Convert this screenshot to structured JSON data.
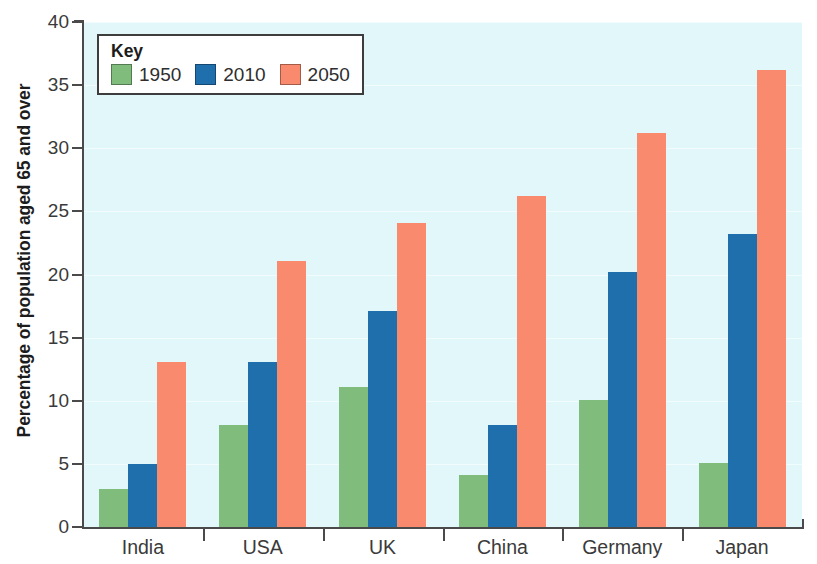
{
  "chart_data": {
    "type": "bar",
    "title": "",
    "subtitle": "",
    "xlabel": "",
    "ylabel": "Percentage of population aged 65 and over",
    "categories": [
      "India",
      "USA",
      "UK",
      "China",
      "Germany",
      "Japan"
    ],
    "series": [
      {
        "name": "1950",
        "color": "#80bd7d",
        "values": [
          3.0,
          8.1,
          11.1,
          4.1,
          10.1,
          5.1
        ]
      },
      {
        "name": "2010",
        "color": "#1f6fad",
        "values": [
          5.0,
          13.1,
          17.1,
          8.1,
          20.2,
          23.2
        ]
      },
      {
        "name": "2050",
        "color": "#fa8a6e",
        "values": [
          13.1,
          21.1,
          24.1,
          26.2,
          31.2,
          36.2
        ]
      }
    ],
    "ylim": [
      0,
      40
    ],
    "ytick_step": 5,
    "yticks": [
      "0",
      "5",
      "10",
      "15",
      "20",
      "25",
      "30",
      "35",
      "40"
    ],
    "grid": true,
    "grid_color": "#f3fcfd",
    "plot_background": "#e2f7fa",
    "axis_color": "#4a4a4a",
    "legend_position": "inside-top-left"
  },
  "legend": {
    "title": "Key",
    "entries": [
      {
        "label": "1950",
        "color": "#80bd7d"
      },
      {
        "label": "2010",
        "color": "#1f6fad"
      },
      {
        "label": "2050",
        "color": "#fa8a6e"
      }
    ]
  }
}
